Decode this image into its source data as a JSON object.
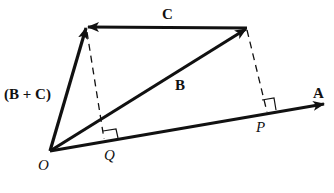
{
  "diagram": {
    "type": "vector-projection",
    "colors": {
      "stroke": "#111111",
      "background": "#ffffff"
    },
    "points": {
      "O": {
        "label": "O",
        "x": 50,
        "y": 151
      },
      "BC_tip": {
        "x": 86,
        "y": 27
      },
      "B_tip": {
        "x": 247,
        "y": 28
      },
      "A_tip": {
        "x": 325,
        "y": 104
      },
      "Q": {
        "label": "Q",
        "x": 104,
        "y": 140
      },
      "P": {
        "label": "P",
        "x": 267,
        "y": 113
      }
    },
    "vectors": [
      {
        "name": "A",
        "label": "A",
        "from": "O",
        "to": "A_tip"
      },
      {
        "name": "B",
        "label": "B",
        "from": "O",
        "to": "B_tip"
      },
      {
        "name": "C",
        "label": "C",
        "from": "B_tip",
        "to": "BC_tip"
      },
      {
        "name": "B+C",
        "label": "(B + C)",
        "from": "O",
        "to": "BC_tip"
      }
    ],
    "projections": [
      {
        "from": "BC_tip",
        "to": "Q",
        "style": "dashed",
        "right_angle": true
      },
      {
        "from": "B_tip",
        "to": "P",
        "style": "dashed",
        "right_angle": true
      }
    ],
    "labels": {
      "A": "A",
      "B": "B",
      "C": "C",
      "BC": "(B + C)",
      "O": "O",
      "Q": "Q",
      "P": "P"
    }
  }
}
